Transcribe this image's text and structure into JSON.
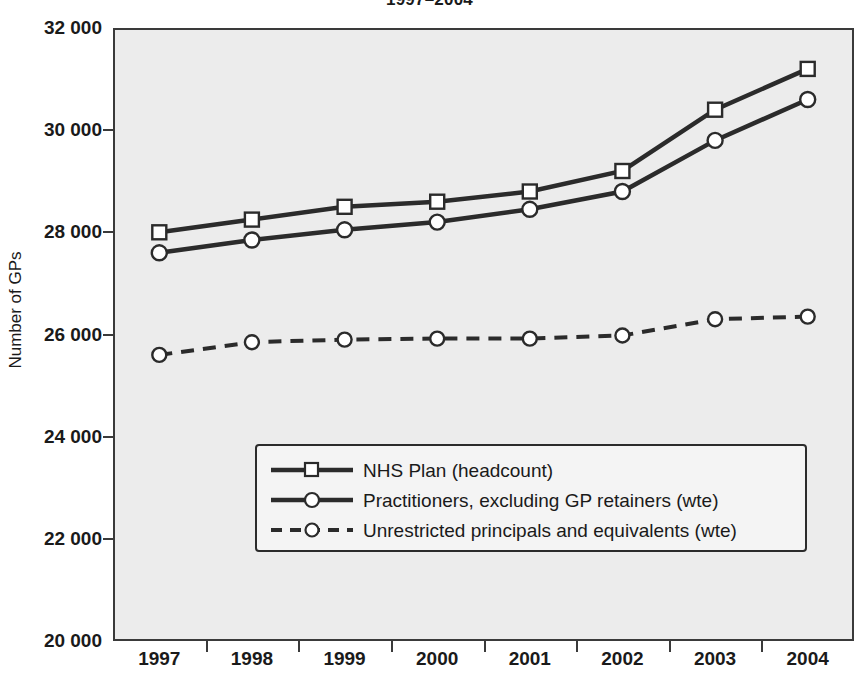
{
  "chart_data": {
    "type": "line",
    "title": "1997–2004",
    "xlabel": "",
    "ylabel": "Number of GPs",
    "grid": false,
    "legend_position": "inside-bottom-center",
    "categories": [
      "1997",
      "1998",
      "1999",
      "2000",
      "2001",
      "2002",
      "2003",
      "2004"
    ],
    "x_tick_labels": [
      "1997",
      "1998",
      "1999",
      "2000",
      "2001",
      "2002",
      "2003",
      "2004"
    ],
    "y_tick_labels": [
      "20 000",
      "22 000",
      "24 000",
      "26 000",
      "28 000",
      "30 000",
      "32 000"
    ],
    "y_tick_values": [
      20000,
      22000,
      24000,
      26000,
      28000,
      30000,
      32000
    ],
    "ylim": [
      20000,
      32000
    ],
    "series": [
      {
        "name": "NHS Plan (headcount)",
        "marker": "square",
        "linestyle": "solid",
        "color": "#2b2b2b",
        "values": [
          28000,
          28250,
          28500,
          28600,
          28800,
          29200,
          30400,
          31200
        ]
      },
      {
        "name": "Practitioners, excluding GP retainers (wte)",
        "marker": "circle",
        "linestyle": "solid",
        "color": "#2b2b2b",
        "values": [
          27600,
          27850,
          28050,
          28200,
          28450,
          28800,
          29800,
          30600
        ]
      },
      {
        "name": "Unrestricted principals and equivalents (wte)",
        "marker": "circle",
        "linestyle": "dashed",
        "color": "#2b2b2b",
        "values": [
          25600,
          25850,
          25900,
          25920,
          25920,
          25980,
          26300,
          26350
        ]
      }
    ],
    "colors": {
      "plot_background": "#ececec",
      "axis": "#3a3a3a",
      "series_line": "#2b2b2b",
      "marker_fill": "#ffffff",
      "legend_background": "#f4f4f4",
      "text": "#1a1a1a"
    }
  }
}
